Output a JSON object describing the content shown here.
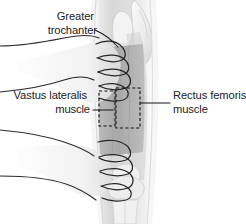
{
  "figure": {
    "background_color": "#ffffff"
  },
  "labels": {
    "greater_trochanter": {
      "name": "Greater trochanter",
      "line1": "Greater",
      "line2": "trochanter",
      "align": "right",
      "x": 97,
      "y": 16
    },
    "vastus_lateralis": {
      "name": "Vastus lateralis muscle",
      "line1": "Vastus lateralis",
      "line2": "muscle",
      "align": "right",
      "x": 90,
      "y": 104
    },
    "rectus_femoris": {
      "name": "Rectus femoris muscle",
      "line1": "Rectus femoris",
      "line2": "muscle",
      "align": "left",
      "x": 172,
      "y": 104
    }
  },
  "anatomy": {
    "thigh": {
      "name": "thigh",
      "skin_light": "#f2f2f2",
      "skin_mid": "#dcdcdc",
      "skin_shadow": "#c2c2c2"
    },
    "muscle_band": {
      "name": "vastus lateralis muscle band",
      "color": "#a8a8a8",
      "opacity": "0.85"
    },
    "bone": {
      "name": "femur and pelvis bone",
      "color": "#ededed",
      "outline": "#b8b8b8"
    },
    "knee": {
      "name": "knee joint",
      "color": "#e8e8e8"
    },
    "hands": {
      "name": "clinician hands grasping thigh",
      "outline_color": "#262629",
      "count": 2
    }
  },
  "markers": {
    "injection_site": {
      "name": "injection site dashed rectangle",
      "stroke_color": "#15151a",
      "style": "dashed",
      "boxes": [
        {
          "label": "left band",
          "x": 99,
          "y": 91,
          "w": 16,
          "h": 35
        },
        {
          "label": "main site",
          "x": 116,
          "y": 88,
          "w": 24,
          "h": 40
        }
      ]
    }
  },
  "leader_lines": {
    "greater_trochanter": "curved line from label down-right to hip region",
    "vastus_lateralis": "horizontal line from 'muscle' to left dashed box",
    "rectus_femoris": "horizontal line from right label to main dashed box"
  },
  "colors": {
    "text": "#1b1b1f",
    "line": "#16161a",
    "background": "#ffffff"
  }
}
